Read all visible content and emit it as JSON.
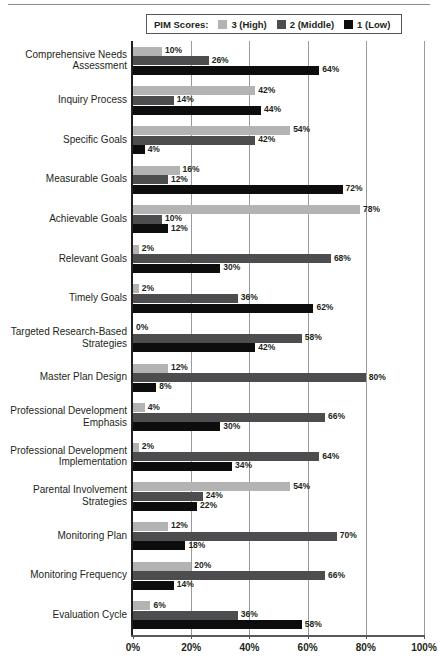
{
  "legend": {
    "title": "PIM Scores:",
    "entries": [
      {
        "label": "3 (High)",
        "color": "#b3b3b3"
      },
      {
        "label": "2 (Middle)",
        "color": "#4d4d4f"
      },
      {
        "label": "1 (Low)",
        "color": "#0d0d0d"
      }
    ]
  },
  "axis": {
    "ticks": [
      "0%",
      "20%",
      "40%",
      "60%",
      "80%",
      "100%"
    ]
  },
  "chart_data": {
    "type": "bar",
    "orientation": "horizontal",
    "title": "",
    "xlabel": "",
    "ylabel": "",
    "xlim": [
      0,
      100
    ],
    "grid": true,
    "legend_position": "top",
    "legend_title": "PIM Scores:",
    "value_suffix": "%",
    "categories": [
      "Comprehensive Needs\nAssessment",
      "Inquiry Process",
      "Specific Goals",
      "Measurable Goals",
      "Achievable Goals",
      "Relevant Goals",
      "Timely Goals",
      "Targeted Research-Based\nStrategies",
      "Master Plan Design",
      "Professional Development\nEmphasis",
      "Professional Development\nImplementation",
      "Parental Involvement\nStrategies",
      "Monitoring Plan",
      "Monitoring Frequency",
      "Evaluation Cycle"
    ],
    "series": [
      {
        "name": "3 (High)",
        "color": "#b3b3b3",
        "values": [
          10,
          42,
          54,
          16,
          78,
          2,
          2,
          0,
          12,
          4,
          2,
          54,
          12,
          20,
          6
        ],
        "labels": [
          "10%",
          "42%",
          "54%",
          "16%",
          "78%",
          "2%",
          "2%",
          "0%",
          "12%",
          "4%",
          "2%",
          "54%",
          "12%",
          "20%",
          "6%"
        ]
      },
      {
        "name": "2 (Middle)",
        "color": "#4d4d4f",
        "values": [
          26,
          14,
          42,
          12,
          10,
          68,
          36,
          58,
          80,
          66,
          64,
          24,
          70,
          66,
          36
        ],
        "labels": [
          "26%",
          "14%",
          "42%",
          "12%",
          "10%",
          "68%",
          "36%",
          "58%",
          "80%",
          "66%",
          "64%",
          "24%",
          "70%",
          "66%",
          "36%"
        ]
      },
      {
        "name": "1 (Low)",
        "color": "#0d0d0d",
        "values": [
          64,
          44,
          4,
          72,
          12,
          30,
          62,
          42,
          8,
          30,
          34,
          22,
          18,
          14,
          58
        ],
        "labels": [
          "64%",
          "44%",
          "4%",
          "72%",
          "12%",
          "30%",
          "62%",
          "42%",
          "8%",
          "30%",
          "34%",
          "22%",
          "18%",
          "14%",
          "58%"
        ]
      }
    ]
  }
}
